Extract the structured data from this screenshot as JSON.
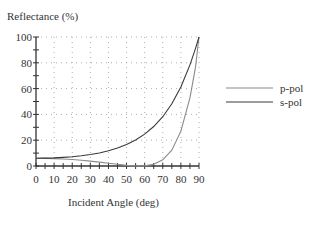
{
  "chart_data": {
    "type": "line",
    "title": "",
    "ylabel": "Reflectance (%)",
    "xlabel": "Incident Angle (deg)",
    "xlim": [
      0,
      90
    ],
    "ylim": [
      0,
      100
    ],
    "x_ticks": [
      "0",
      "10",
      "20",
      "30",
      "40",
      "50",
      "60",
      "70",
      "80",
      "90"
    ],
    "y_ticks": [
      "0",
      "20",
      "40",
      "60",
      "80",
      "100"
    ],
    "grid": true,
    "legend_position": "right",
    "x": [
      0,
      5,
      10,
      15,
      20,
      25,
      30,
      35,
      40,
      45,
      50,
      55,
      60,
      65,
      70,
      75,
      80,
      85,
      88,
      90
    ],
    "series": [
      {
        "name": "p-pol",
        "color": "#8a8a8a",
        "values": [
          6.0,
          5.9,
          5.7,
          5.4,
          5.0,
          4.5,
          3.8,
          3.0,
          2.1,
          1.3,
          0.5,
          0.06,
          0.1,
          1.3,
          4.8,
          12.3,
          27.0,
          52.8,
          76.0,
          100
        ]
      },
      {
        "name": "s-pol",
        "color": "#3a3a3a",
        "values": [
          6.0,
          6.1,
          6.3,
          6.7,
          7.2,
          7.9,
          8.9,
          10.1,
          11.8,
          13.9,
          16.6,
          20.1,
          24.7,
          30.6,
          38.2,
          48.2,
          61.2,
          78.4,
          90.8,
          100
        ]
      }
    ]
  }
}
